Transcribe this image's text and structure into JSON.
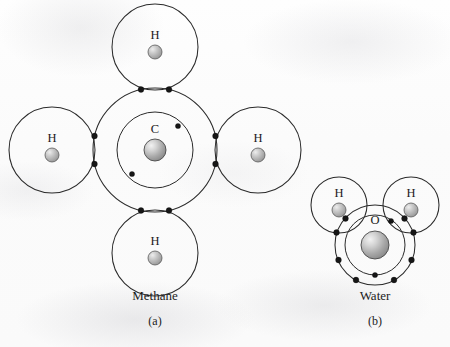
{
  "figure": {
    "background_color": "#fdfdfd",
    "line_color": "#2b2b2b",
    "electron_color": "#161616",
    "nucleus_fill_light": "#e8e8e8",
    "nucleus_fill_dark": "#8d8d8d"
  },
  "panels": [
    {
      "id": "methane",
      "title": "Methane",
      "sublabel": "(a)",
      "formula_atoms": [
        {
          "symbol": "C",
          "role": "central",
          "shells": 2,
          "inner_electrons": 2,
          "outer_electrons": 8
        },
        {
          "symbol": "H",
          "role": "ligand",
          "position": "top",
          "shells": 1,
          "shell_electrons": 2
        },
        {
          "symbol": "H",
          "role": "ligand",
          "position": "left",
          "shells": 1,
          "shell_electrons": 2
        },
        {
          "symbol": "H",
          "role": "ligand",
          "position": "right",
          "shells": 1,
          "shell_electrons": 2
        },
        {
          "symbol": "H",
          "role": "ligand",
          "position": "bottom",
          "shells": 1,
          "shell_electrons": 2
        }
      ],
      "bond_pairs": 4,
      "title_x": 155,
      "title_y": 300,
      "sub_x": 155,
      "sub_y": 325
    },
    {
      "id": "water",
      "title": "Water",
      "sublabel": "(b)",
      "formula_atoms": [
        {
          "symbol": "O",
          "role": "central",
          "shells": 2,
          "inner_electrons": 2,
          "outer_electrons": 8
        },
        {
          "symbol": "H",
          "role": "ligand",
          "position": "upper-left",
          "shells": 1,
          "shell_electrons": 2
        },
        {
          "symbol": "H",
          "role": "ligand",
          "position": "upper-right",
          "shells": 1,
          "shell_electrons": 2
        }
      ],
      "bond_pairs": 2,
      "title_x": 375,
      "title_y": 300,
      "sub_x": 375,
      "sub_y": 325
    }
  ],
  "labels": {
    "carbon": "C",
    "oxygen": "O",
    "hydrogen": "H",
    "methane_title": "Methane",
    "methane_sub": "(a)",
    "water_title": "Water",
    "water_sub": "(b)"
  },
  "geometry": {
    "methane": {
      "carbon_center": [
        155,
        150
      ],
      "carbon_outer_r": 62,
      "carbon_inner_r": 38,
      "nucleus_r": 11,
      "h_ring_r": 43,
      "h_nucleus_r": 7,
      "h_centers": {
        "top": [
          155,
          47
        ],
        "left": [
          52,
          150
        ],
        "right": [
          258,
          150
        ],
        "bottom": [
          155,
          253
        ]
      },
      "c_inner_electrons": [
        [
          178,
          126
        ],
        [
          132,
          174
        ]
      ]
    },
    "water": {
      "oxygen_center": [
        375,
        245
      ],
      "oxygen_outer_r": 40,
      "oxygen_inner_r": 30,
      "nucleus_r": 14,
      "h_ring_r": 28,
      "h_nucleus_r": 7,
      "h_centers": {
        "left": [
          339,
          205
        ],
        "right": [
          411,
          205
        ]
      }
    }
  }
}
